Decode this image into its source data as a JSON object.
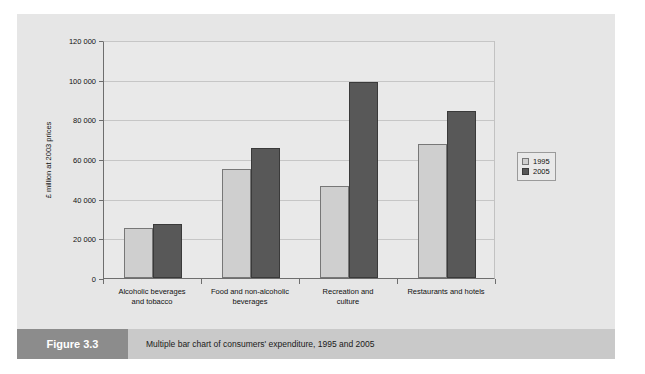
{
  "figure": {
    "number_label": "Figure 3.3",
    "caption": "Multiple bar chart of consumers' expenditure, 1995 and 2005"
  },
  "chart_data": {
    "type": "bar",
    "title": "",
    "xlabel": "",
    "ylabel": "£ million at 2003 prices",
    "categories": [
      "Alcoholic beverages\nand tobacco",
      "Food and non-alcoholic\nbeverages",
      "Recreation and\nculture",
      "Restaurants and hotels"
    ],
    "series": [
      {
        "name": "1995",
        "color": "#cfcfcf",
        "values": [
          25400,
          54800,
          46400,
          67400
        ]
      },
      {
        "name": "2005",
        "color": "#585858",
        "values": [
          27100,
          65500,
          99000,
          84000
        ]
      }
    ],
    "ylim": [
      0,
      120000
    ],
    "ytick_values": [
      0,
      20000,
      40000,
      60000,
      80000,
      100000,
      120000
    ],
    "ytick_labels": [
      "0",
      "20 000",
      "40 000",
      "60 000",
      "80 000",
      "100 000",
      "120 000"
    ],
    "grid": true,
    "legend_position": "right"
  }
}
